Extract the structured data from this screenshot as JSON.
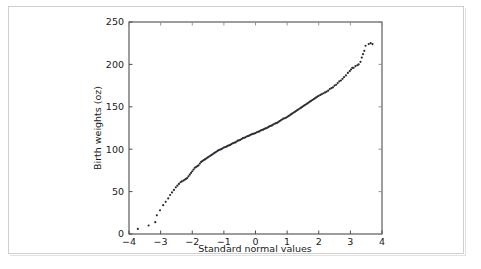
{
  "figure": {
    "background_color": "#ffffff",
    "border_color": "#cfcfcf",
    "axis_color": "#4d4d4d",
    "point_color": "#2b2b33"
  },
  "chart_data": {
    "type": "scatter",
    "title": "",
    "xlabel": "Standard normal values",
    "ylabel": "Birth weights (oz)",
    "xlim": [
      -4,
      4
    ],
    "ylim": [
      0,
      250
    ],
    "xticks": [
      -4,
      -3,
      -2,
      -1,
      0,
      1,
      2,
      3,
      4
    ],
    "xticklabels": [
      "−4",
      "−3",
      "−2",
      "−1",
      "0",
      "1",
      "2",
      "3",
      "4"
    ],
    "yticks": [
      0,
      50,
      100,
      150,
      200,
      250
    ],
    "yticklabels": [
      "0",
      "50",
      "100",
      "150",
      "200",
      "250"
    ],
    "grid": false,
    "legend": null,
    "marker": "point",
    "marker_size": 1.1,
    "points": [
      [
        -3.72,
        6
      ],
      [
        -3.38,
        10
      ],
      [
        -3.17,
        14
      ],
      [
        -3.12,
        22
      ],
      [
        -3.02,
        28
      ],
      [
        -2.92,
        34
      ],
      [
        -2.84,
        38
      ],
      [
        -2.76,
        42
      ],
      [
        -2.7,
        46
      ],
      [
        -2.64,
        49
      ],
      [
        -2.58,
        52
      ],
      [
        -2.52,
        55
      ],
      [
        -2.47,
        57
      ],
      [
        -2.42,
        59
      ],
      [
        -2.37,
        61
      ],
      [
        -2.33,
        62
      ],
      [
        -2.28,
        63
      ],
      [
        -2.24,
        64
      ],
      [
        -2.2,
        65
      ],
      [
        -2.16,
        66
      ],
      [
        -2.12,
        68
      ],
      [
        -2.08,
        70
      ],
      [
        -2.04,
        72
      ],
      [
        -2.0,
        74
      ],
      [
        -1.96,
        76
      ],
      [
        -1.92,
        78
      ],
      [
        -1.88,
        79
      ],
      [
        -1.84,
        80
      ],
      [
        -1.8,
        81
      ],
      [
        -1.76,
        83
      ],
      [
        -1.72,
        85
      ],
      [
        -1.68,
        86
      ],
      [
        -1.64,
        87
      ],
      [
        -1.6,
        88
      ],
      [
        -1.56,
        89
      ],
      [
        -1.52,
        90
      ],
      [
        -1.48,
        91
      ],
      [
        -1.44,
        92
      ],
      [
        -1.4,
        93
      ],
      [
        -1.36,
        94
      ],
      [
        -1.32,
        95
      ],
      [
        -1.28,
        96
      ],
      [
        -1.24,
        97
      ],
      [
        -1.2,
        98
      ],
      [
        -1.16,
        99
      ],
      [
        -1.12,
        99.5
      ],
      [
        -1.08,
        100
      ],
      [
        -1.04,
        101
      ],
      [
        -1.0,
        102
      ],
      [
        -0.96,
        102.5
      ],
      [
        -0.92,
        103
      ],
      [
        -0.88,
        104
      ],
      [
        -0.84,
        104.5
      ],
      [
        -0.8,
        105
      ],
      [
        -0.76,
        106
      ],
      [
        -0.72,
        107
      ],
      [
        -0.68,
        107.5
      ],
      [
        -0.64,
        108
      ],
      [
        -0.6,
        109
      ],
      [
        -0.56,
        110
      ],
      [
        -0.52,
        110.5
      ],
      [
        -0.48,
        111
      ],
      [
        -0.44,
        112
      ],
      [
        -0.4,
        113
      ],
      [
        -0.36,
        113.5
      ],
      [
        -0.32,
        114
      ],
      [
        -0.28,
        115
      ],
      [
        -0.24,
        115.5
      ],
      [
        -0.2,
        116
      ],
      [
        -0.16,
        117
      ],
      [
        -0.12,
        117.5
      ],
      [
        -0.08,
        118
      ],
      [
        -0.04,
        118.5
      ],
      [
        0.0,
        119
      ],
      [
        0.04,
        120
      ],
      [
        0.08,
        120.5
      ],
      [
        0.12,
        121
      ],
      [
        0.16,
        122
      ],
      [
        0.2,
        122.5
      ],
      [
        0.24,
        123
      ],
      [
        0.28,
        124
      ],
      [
        0.32,
        124.5
      ],
      [
        0.36,
        125
      ],
      [
        0.4,
        126
      ],
      [
        0.44,
        127
      ],
      [
        0.48,
        127.5
      ],
      [
        0.52,
        128
      ],
      [
        0.56,
        129
      ],
      [
        0.6,
        130
      ],
      [
        0.64,
        130.5
      ],
      [
        0.68,
        131
      ],
      [
        0.72,
        132
      ],
      [
        0.76,
        133
      ],
      [
        0.8,
        134
      ],
      [
        0.84,
        135
      ],
      [
        0.88,
        136
      ],
      [
        0.92,
        136.5
      ],
      [
        0.96,
        137
      ],
      [
        1.0,
        138
      ],
      [
        1.04,
        139
      ],
      [
        1.08,
        140
      ],
      [
        1.12,
        141
      ],
      [
        1.16,
        142
      ],
      [
        1.2,
        143
      ],
      [
        1.24,
        144
      ],
      [
        1.28,
        145
      ],
      [
        1.32,
        146
      ],
      [
        1.36,
        147
      ],
      [
        1.4,
        148
      ],
      [
        1.44,
        149
      ],
      [
        1.48,
        150
      ],
      [
        1.52,
        151
      ],
      [
        1.56,
        152
      ],
      [
        1.6,
        153
      ],
      [
        1.64,
        154
      ],
      [
        1.68,
        155
      ],
      [
        1.72,
        156
      ],
      [
        1.76,
        157
      ],
      [
        1.8,
        158
      ],
      [
        1.84,
        159
      ],
      [
        1.88,
        160
      ],
      [
        1.92,
        161
      ],
      [
        1.96,
        162
      ],
      [
        2.0,
        163
      ],
      [
        2.05,
        164
      ],
      [
        2.1,
        165
      ],
      [
        2.15,
        166
      ],
      [
        2.2,
        167
      ],
      [
        2.25,
        168
      ],
      [
        2.3,
        169
      ],
      [
        2.35,
        171
      ],
      [
        2.4,
        172
      ],
      [
        2.45,
        173
      ],
      [
        2.5,
        175
      ],
      [
        2.55,
        176
      ],
      [
        2.6,
        178
      ],
      [
        2.65,
        180
      ],
      [
        2.7,
        181
      ],
      [
        2.75,
        183
      ],
      [
        2.8,
        185
      ],
      [
        2.86,
        187
      ],
      [
        2.92,
        190
      ],
      [
        2.98,
        192
      ],
      [
        3.02,
        194
      ],
      [
        3.06,
        196
      ],
      [
        3.1,
        196
      ],
      [
        3.16,
        198
      ],
      [
        3.22,
        199
      ],
      [
        3.26,
        200
      ],
      [
        3.32,
        203
      ],
      [
        3.36,
        208
      ],
      [
        3.4,
        212
      ],
      [
        3.44,
        216
      ],
      [
        3.48,
        222
      ],
      [
        3.58,
        224
      ],
      [
        3.64,
        225
      ],
      [
        3.7,
        224
      ]
    ]
  }
}
